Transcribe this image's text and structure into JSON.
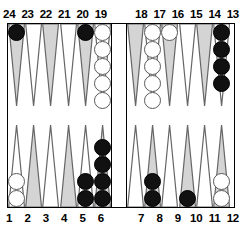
{
  "board": {
    "title": "Backgammon board position",
    "top_point_labels": [
      "24",
      "23",
      "22",
      "21",
      "20",
      "19",
      "18",
      "17",
      "16",
      "15",
      "14",
      "13"
    ],
    "bottom_point_labels": [
      "1",
      "2",
      "3",
      "4",
      "5",
      "6",
      "7",
      "8",
      "9",
      "10",
      "11",
      "12"
    ],
    "colors": {
      "black_checker": "#111111",
      "white_checker": "#ffffff",
      "point_shaded": "#d4d4d4",
      "point_light": "#ffffff",
      "border": "#000000",
      "label_text": "#000000"
    },
    "bar": {
      "black_checkers": 0,
      "white_checkers": 0
    },
    "counts": {
      "black_total": 15,
      "white_total": 15
    },
    "points": [
      {
        "label": "24",
        "position": "top",
        "shaded": true,
        "color": "black",
        "count": 1
      },
      {
        "label": "23",
        "position": "top",
        "shaded": false,
        "color": "none",
        "count": 0
      },
      {
        "label": "22",
        "position": "top",
        "shaded": true,
        "color": "none",
        "count": 0
      },
      {
        "label": "21",
        "position": "top",
        "shaded": false,
        "color": "none",
        "count": 0
      },
      {
        "label": "20",
        "position": "top",
        "shaded": true,
        "color": "black",
        "count": 1
      },
      {
        "label": "19",
        "position": "top",
        "shaded": false,
        "color": "white",
        "count": 5
      },
      {
        "label": "18",
        "position": "top",
        "shaded": true,
        "color": "none",
        "count": 0
      },
      {
        "label": "17",
        "position": "top",
        "shaded": false,
        "color": "white",
        "count": 5
      },
      {
        "label": "16",
        "position": "top",
        "shaded": true,
        "color": "white",
        "count": 1
      },
      {
        "label": "15",
        "position": "top",
        "shaded": false,
        "color": "none",
        "count": 0
      },
      {
        "label": "14",
        "position": "top",
        "shaded": true,
        "color": "none",
        "count": 0
      },
      {
        "label": "13",
        "position": "top",
        "shaded": false,
        "color": "black",
        "count": 4
      },
      {
        "label": "1",
        "position": "bottom",
        "shaded": false,
        "color": "white",
        "count": 2
      },
      {
        "label": "2",
        "position": "bottom",
        "shaded": true,
        "color": "none",
        "count": 0
      },
      {
        "label": "3",
        "position": "bottom",
        "shaded": false,
        "color": "none",
        "count": 0
      },
      {
        "label": "4",
        "position": "bottom",
        "shaded": true,
        "color": "none",
        "count": 0
      },
      {
        "label": "5",
        "position": "bottom",
        "shaded": false,
        "color": "black",
        "count": 2
      },
      {
        "label": "6",
        "position": "bottom",
        "shaded": true,
        "color": "black",
        "count": 4
      },
      {
        "label": "7",
        "position": "bottom",
        "shaded": false,
        "color": "none",
        "count": 0
      },
      {
        "label": "8",
        "position": "bottom",
        "shaded": true,
        "color": "black",
        "count": 2
      },
      {
        "label": "9",
        "position": "bottom",
        "shaded": false,
        "color": "none",
        "count": 0
      },
      {
        "label": "10",
        "position": "bottom",
        "shaded": true,
        "color": "black",
        "count": 1
      },
      {
        "label": "11",
        "position": "bottom",
        "shaded": false,
        "color": "none",
        "count": 0
      },
      {
        "label": "12",
        "position": "bottom",
        "shaded": true,
        "color": "white",
        "count": 2
      }
    ]
  }
}
